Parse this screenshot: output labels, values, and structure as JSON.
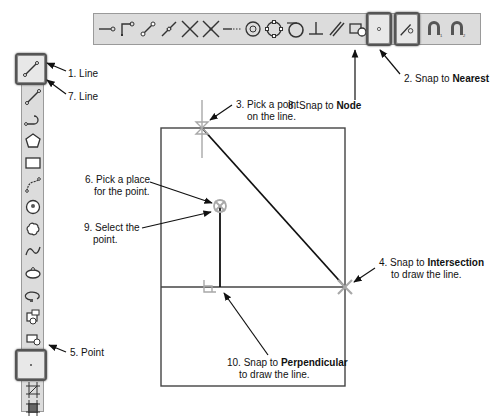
{
  "toolbar_top": {
    "tools": [
      {
        "name": "snap-endpoint-icon"
      },
      {
        "name": "snap-corner-icon"
      },
      {
        "name": "snap-line-endpoints-icon"
      },
      {
        "name": "snap-midpoint-icon"
      },
      {
        "name": "snap-intersection-icon"
      },
      {
        "name": "snap-apparent-intersection-icon"
      },
      {
        "name": "snap-extension-icon"
      },
      {
        "name": "snap-center-icon"
      },
      {
        "name": "snap-quadrant-icon"
      },
      {
        "name": "snap-tangent-icon"
      },
      {
        "name": "snap-perpendicular-icon"
      },
      {
        "name": "snap-parallel-icon"
      },
      {
        "name": "snap-insert-icon"
      },
      {
        "name": "snap-node-icon"
      },
      {
        "name": "snap-nearest-icon"
      },
      {
        "name": "snap-magnet-1-icon"
      },
      {
        "name": "snap-magnet-2-icon"
      }
    ]
  },
  "toolbar_left": {
    "tools": [
      {
        "name": "line-icon"
      },
      {
        "name": "line-alt-icon"
      },
      {
        "name": "arc-polyline-icon"
      },
      {
        "name": "polygon-icon"
      },
      {
        "name": "rectangle-icon"
      },
      {
        "name": "spline-icon"
      },
      {
        "name": "circle-icon"
      },
      {
        "name": "revcloud-icon"
      },
      {
        "name": "wave-icon"
      },
      {
        "name": "ellipse-icon"
      },
      {
        "name": "ellipse-arc-icon"
      },
      {
        "name": "insert-block-icon"
      },
      {
        "name": "make-block-icon"
      },
      {
        "name": "point-icon"
      },
      {
        "name": "hatch-icon"
      },
      {
        "name": "gradient-icon"
      }
    ]
  },
  "callouts": {
    "c1": {
      "text": "1. Line"
    },
    "c7": {
      "text": "7. Line"
    },
    "c2": {
      "prefix": "2. Snap to ",
      "bold": "Nearest"
    },
    "c8": {
      "prefix": "8. Snap to ",
      "bold": "Node"
    },
    "c3": {
      "line1": "3. Pick a point",
      "line2": "on the line."
    },
    "c6": {
      "line1": "6. Pick a place",
      "line2": "for the point."
    },
    "c9": {
      "line1": "9. Select the",
      "line2": "point."
    },
    "c4": {
      "prefix": "4. Snap to ",
      "bold": "Intersection",
      "line2": "to draw the line."
    },
    "c5": {
      "text": "5. Point"
    },
    "c10": {
      "prefix": "10. Snap to ",
      "bold": "Perpendicular",
      "line2": "to draw the line."
    }
  },
  "colors": {
    "line": "#111111",
    "marker": "#a8a8a8",
    "toolbar": "#dcdcdc"
  }
}
